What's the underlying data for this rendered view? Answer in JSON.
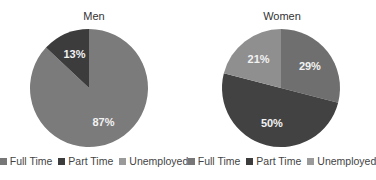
{
  "chart_data": [
    {
      "type": "pie",
      "title": "Men",
      "categories": [
        "Full Time",
        "Part Time",
        "Unemployed"
      ],
      "values": [
        87,
        13,
        0
      ],
      "labels": [
        "87%",
        "13%",
        ""
      ],
      "colors": [
        "#7b7b7b",
        "#3c3c3c",
        "#8f8f8f"
      ],
      "legend_position": "bottom"
    },
    {
      "type": "pie",
      "title": "Women",
      "categories": [
        "Full Time",
        "Part Time",
        "Unemployed"
      ],
      "values": [
        29,
        50,
        21
      ],
      "labels": [
        "29%",
        "50%",
        "21%"
      ],
      "colors": [
        "#6f6f6f",
        "#424242",
        "#8f8f8f"
      ],
      "legend_position": "bottom"
    }
  ],
  "legend": {
    "items": [
      {
        "label": "Full Time",
        "color": "#777777"
      },
      {
        "label": "Part Time",
        "color": "#3c3c3c"
      },
      {
        "label": "Unemployed",
        "color": "#9a9a9a"
      }
    ]
  }
}
